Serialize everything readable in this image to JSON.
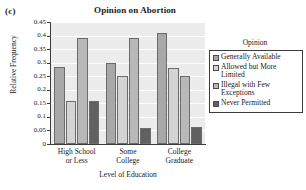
{
  "panel_label": "(c)",
  "chart_data": {
    "type": "bar",
    "title": "Opinion on Abortion",
    "xlabel": "Level of Education",
    "ylabel": "Relative Frequency",
    "ylim": [
      0,
      0.45
    ],
    "grid": true,
    "legend_position": "right",
    "legend_title": "Opinion",
    "y_ticks": [
      "0",
      "0.05",
      "0.1",
      "0.15",
      "0.2",
      "0.25",
      "0.3",
      "0.35",
      "0.4",
      "0.45"
    ],
    "y_tick_values": [
      0,
      0.05,
      0.1,
      0.15,
      0.2,
      0.25,
      0.3,
      0.35,
      0.4,
      0.45
    ],
    "categories": [
      "High School or Less",
      "Some College",
      "College Graduate"
    ],
    "category_lines": [
      [
        "High School",
        "or Less"
      ],
      [
        "Some",
        "College"
      ],
      [
        "College",
        "Graduate"
      ]
    ],
    "series": [
      {
        "name": "Generally Available",
        "name_lines": [
          "Generally Available"
        ],
        "color": "#a8a8a8",
        "values": [
          0.285,
          0.3,
          0.41
        ]
      },
      {
        "name": "Allowed but More Limited",
        "name_lines": [
          "Allowed but More",
          "Limited"
        ],
        "color": "#d4d4d4",
        "values": [
          0.16,
          0.25,
          0.28
        ]
      },
      {
        "name": "Illegal with Few Exceptions",
        "name_lines": [
          "Illegal with Few",
          "Exceptions"
        ],
        "color": "#b8b8b8",
        "values": [
          0.39,
          0.39,
          0.25
        ]
      },
      {
        "name": "Never Permitted",
        "name_lines": [
          "Never Permitted"
        ],
        "color": "#616161",
        "values": [
          0.16,
          0.058,
          0.062
        ]
      }
    ]
  }
}
